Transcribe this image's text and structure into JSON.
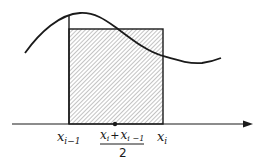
{
  "diagram": {
    "type": "midpoint-rule-rectangle",
    "colors": {
      "stroke": "#1a1a1a",
      "hatch": "#6e6e6e",
      "background": "#ffffff"
    },
    "labels": {
      "left_point": {
        "base": "x",
        "sub": "i−1"
      },
      "right_point": {
        "base": "x",
        "sub": "i"
      },
      "midpoint": {
        "numerator_a": {
          "base": "x",
          "sub": "i"
        },
        "plus": "+",
        "numerator_b": {
          "base": "x",
          "sub": "i −1"
        },
        "denominator": "2"
      }
    },
    "elements": {
      "curve": "smooth function curve f(x)",
      "rectangle": "hatched rectangle with height f(midpoint)",
      "axis": "horizontal x-axis with arrow",
      "midpoint_dot": "dot on axis at midpoint"
    }
  }
}
